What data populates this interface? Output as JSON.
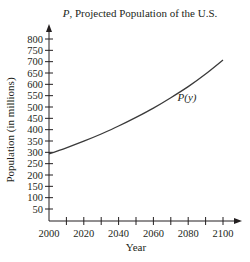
{
  "chart_data": {
    "type": "line",
    "title": "P, Projected Population of the U.S.",
    "title_italic_part": "P",
    "title_rest": ", Projected Population of the U.S.",
    "xlabel": "Year",
    "ylabel": "Population (in millions)",
    "xlim": [
      2000,
      2100
    ],
    "ylim": [
      0,
      800
    ],
    "x_ticks": [
      2000,
      2010,
      2020,
      2030,
      2040,
      2050,
      2060,
      2070,
      2080,
      2090,
      2100
    ],
    "x_tick_labels": [
      "2000",
      "2020",
      "2040",
      "2060",
      "2080",
      "2100"
    ],
    "y_ticks": [
      50,
      100,
      150,
      200,
      250,
      300,
      350,
      400,
      450,
      500,
      550,
      600,
      650,
      700,
      750,
      800
    ],
    "y_tick_labels": [
      "50",
      "100",
      "150",
      "200",
      "250",
      "300",
      "350",
      "400",
      "450",
      "500",
      "550",
      "600",
      "650",
      "700",
      "750",
      "800"
    ],
    "grid": false,
    "legend": null,
    "series": [
      {
        "name": "P(y)",
        "label": "P(y)",
        "x": [
          2000,
          2010,
          2020,
          2030,
          2040,
          2050,
          2060,
          2070,
          2080,
          2090,
          2100
        ],
        "values": [
          293,
          320,
          349,
          381,
          416,
          454,
          495,
          541,
          590,
          645,
          707
        ]
      }
    ],
    "annotations": [
      {
        "text": "P(y)",
        "x": 2075,
        "y": 535
      }
    ],
    "colors": {
      "line": "#3a3a3a",
      "axis": "#231f20"
    }
  }
}
